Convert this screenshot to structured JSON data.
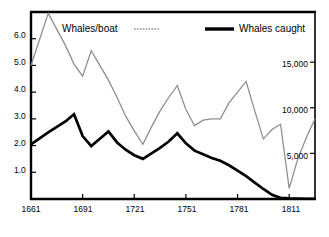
{
  "chart_data": {
    "type": "line",
    "title": "",
    "subtitle": "",
    "xlabel": "",
    "ylabel": "",
    "grid": false,
    "legend_position": "top-inside",
    "x": [
      1661,
      1671,
      1681,
      1686,
      1691,
      1696,
      1701,
      1706,
      1711,
      1716,
      1721,
      1726,
      1731,
      1736,
      1741,
      1746,
      1751,
      1756,
      1761,
      1766,
      1771,
      1776,
      1781,
      1786,
      1791,
      1796,
      1801,
      1806,
      1811,
      1816,
      1821,
      1826
    ],
    "xlim": [
      1661,
      1826
    ],
    "xticks": [
      1661,
      1691,
      1721,
      1751,
      1781,
      1811
    ],
    "xtick_labels": [
      "1661",
      "1691",
      "1721",
      "1751",
      "1781",
      "1811"
    ],
    "left_axis": {
      "name": "Whales/boat",
      "ylim": [
        0,
        7.0
      ],
      "yticks": [
        1.0,
        2.0,
        3.0,
        4.0,
        5.0,
        6.0
      ],
      "ytick_labels": [
        "1.0",
        "2.0",
        "3.0",
        "4.0",
        "5.0",
        "6.0"
      ]
    },
    "right_axis": {
      "name": "Whales caught",
      "ylim": [
        0,
        20500
      ],
      "yticks": [
        5000,
        10000,
        15000
      ],
      "ytick_labels": [
        "5,000",
        "10,000",
        "15,000"
      ]
    },
    "series": [
      {
        "name": "Whales/boat",
        "axis": "left",
        "style": "thin-gray-dotted",
        "color": "#8c8c8c",
        "values": [
          5.0,
          6.95,
          5.75,
          5.05,
          4.6,
          5.55,
          5.0,
          4.45,
          3.8,
          3.1,
          2.55,
          2.05,
          2.7,
          3.3,
          3.8,
          4.25,
          3.35,
          2.75,
          2.95,
          3.0,
          3.0,
          3.6,
          4.0,
          4.4,
          3.3,
          2.25,
          2.6,
          2.8,
          0.4,
          1.5,
          2.3,
          3.0
        ]
      },
      {
        "name": "Whales caught",
        "axis": "right",
        "style": "thick-black",
        "color": "#000000",
        "values": [
          6000,
          7300,
          8500,
          9300,
          6900,
          5800,
          6600,
          7400,
          6200,
          5400,
          4800,
          4400,
          5000,
          5600,
          6300,
          7200,
          6100,
          5300,
          4900,
          4500,
          4200,
          3700,
          3100,
          2500,
          1800,
          1100,
          450,
          130,
          60,
          40,
          30,
          25
        ]
      }
    ],
    "legend": [
      {
        "label": "Whales/boat",
        "marker": "thin-gray-dotted-line",
        "color": "#8c8c8c"
      },
      {
        "label": "Whales caught",
        "marker": "thick-black-line",
        "color": "#000000"
      }
    ]
  },
  "colors": {
    "background": "#ffffff",
    "frame": "#000000",
    "whales_per_boat": "#8c8c8c",
    "whales_caught": "#000000"
  }
}
